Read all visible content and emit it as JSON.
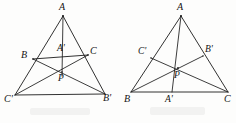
{
  "figure": {
    "ink_color": "#1b1b1b",
    "background_color": "#fdfdfc",
    "left_figure": {
      "name": "left-triangle-diagram",
      "description": "Triangle A C' B' with interior triangle B A' C and cevians meeting at P",
      "points": {
        "A": {
          "x": 63,
          "y": 16,
          "label": "A"
        },
        "B": {
          "x": 33,
          "y": 59,
          "label": "B"
        },
        "C": {
          "x": 88,
          "y": 55,
          "label": "C"
        },
        "Ap": {
          "x": 63,
          "y": 57,
          "label": "A'"
        },
        "P": {
          "x": 62,
          "y": 72,
          "label": "P"
        },
        "Cp": {
          "x": 15,
          "y": 95,
          "label": "C'"
        },
        "Bp": {
          "x": 105,
          "y": 94,
          "label": "B'"
        }
      },
      "label_positions": {
        "A": {
          "x": 59,
          "y": 2
        },
        "B": {
          "x": 21,
          "y": 50
        },
        "C": {
          "x": 90,
          "y": 46
        },
        "Ap": {
          "x": 57,
          "y": 44
        },
        "P": {
          "x": 58,
          "y": 74
        },
        "Cp": {
          "x": 4,
          "y": 94
        },
        "Bp": {
          "x": 103,
          "y": 93
        }
      },
      "segments": [
        {
          "from": "A",
          "to": "Cp",
          "kind": "edge"
        },
        {
          "from": "A",
          "to": "Bp",
          "kind": "edge"
        },
        {
          "from": "Cp",
          "to": "Bp",
          "kind": "edge"
        },
        {
          "from": "B",
          "to": "C",
          "kind": "edge"
        },
        {
          "from": "A",
          "to": "P",
          "kind": "cevian"
        },
        {
          "from": "B",
          "to": "Bp",
          "kind": "cevian"
        },
        {
          "from": "C",
          "to": "Cp",
          "kind": "cevian"
        }
      ]
    },
    "right_figure": {
      "name": "right-triangle-diagram",
      "description": "Triangle A B C with cevians A-A', B-B', C-C' concurrent at P",
      "points": {
        "A": {
          "x": 181,
          "y": 16,
          "label": "A"
        },
        "B": {
          "x": 131,
          "y": 92,
          "label": "B"
        },
        "C": {
          "x": 228,
          "y": 92,
          "label": "C"
        },
        "Cp": {
          "x": 151,
          "y": 58,
          "label": "C'"
        },
        "Bp": {
          "x": 203,
          "y": 56,
          "label": "B'"
        },
        "P": {
          "x": 178,
          "y": 68,
          "label": "P"
        },
        "Ap": {
          "x": 172,
          "y": 92,
          "label": "A'"
        }
      },
      "label_positions": {
        "A": {
          "x": 177,
          "y": 2
        },
        "B": {
          "x": 124,
          "y": 94
        },
        "C": {
          "x": 224,
          "y": 94
        },
        "Cp": {
          "x": 138,
          "y": 47
        },
        "Bp": {
          "x": 205,
          "y": 45
        },
        "P": {
          "x": 174,
          "y": 71
        },
        "Ap": {
          "x": 165,
          "y": 95
        }
      },
      "segments": [
        {
          "from": "A",
          "to": "B",
          "kind": "edge"
        },
        {
          "from": "A",
          "to": "C",
          "kind": "edge"
        },
        {
          "from": "B",
          "to": "C",
          "kind": "edge"
        },
        {
          "from": "A",
          "to": "Ap",
          "kind": "cevian"
        },
        {
          "from": "B",
          "to": "Bp",
          "kind": "cevian"
        },
        {
          "from": "C",
          "to": "Cp",
          "kind": "cevian"
        }
      ]
    }
  }
}
